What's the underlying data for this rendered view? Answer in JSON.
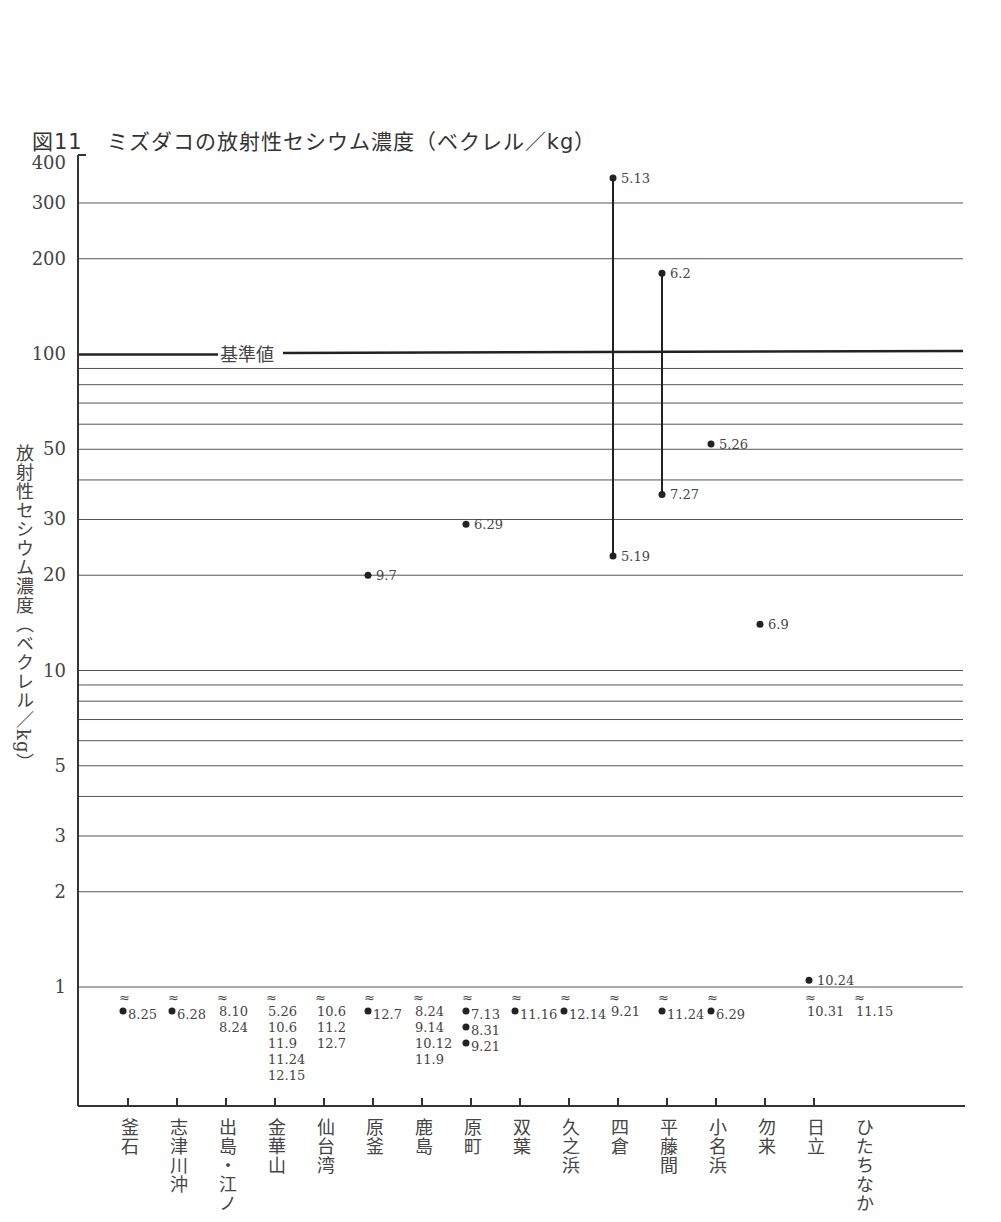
{
  "title": {
    "figure_no": "図11",
    "text": "ミズダコの放射性セシウム濃度（ベクレル／kg）"
  },
  "y_axis_title": "放射性セシウム濃度（ベクレル／kg）",
  "reference_line_label": "基準値",
  "chart_data": {
    "type": "scatter",
    "xlabel": "",
    "ylabel": "放射性セシウム濃度（ベクレル／kg）",
    "yscale": "log",
    "ylim": [
      0.5,
      400
    ],
    "y_ticks": [
      1,
      2,
      3,
      5,
      10,
      20,
      30,
      50,
      100,
      200,
      300,
      400
    ],
    "y_tick_labels": [
      "1",
      "2",
      "3",
      "5",
      "10",
      "20",
      "30",
      "50",
      "100",
      "200",
      "300",
      "400"
    ],
    "grid": true,
    "reference_line": {
      "value": 100,
      "label": "基準値"
    },
    "not_detected_symbol": "≈",
    "categories": [
      "釜石",
      "志津川沖",
      "出島・江ノ",
      "金華山",
      "仙台湾",
      "原釜",
      "鹿島",
      "原町",
      "双葉",
      "久之浜",
      "四倉",
      "平藤間",
      "小名浜",
      "勿来",
      "日立",
      "ひたちなか"
    ],
    "points": [
      {
        "site": "四倉",
        "date": "5.13",
        "value": 360
      },
      {
        "site": "四倉",
        "date": "5.19",
        "value": 23
      },
      {
        "site": "平藤間",
        "date": "6.2",
        "value": 180
      },
      {
        "site": "平藤間",
        "date": "7.27",
        "value": 36
      },
      {
        "site": "小名浜",
        "date": "5.26",
        "value": 52
      },
      {
        "site": "原町",
        "date": "6.29",
        "value": 29
      },
      {
        "site": "原釜",
        "date": "9.7",
        "value": 20
      },
      {
        "site": "勿来",
        "date": "6.9",
        "value": 14
      },
      {
        "site": "日立",
        "date": "10.24",
        "value": 1.05
      }
    ],
    "not_detected": [
      {
        "site": "釜石",
        "dates": [
          "8.25"
        ],
        "with_marker": true
      },
      {
        "site": "志津川沖",
        "dates": [
          "6.28"
        ],
        "with_marker": true
      },
      {
        "site": "出島・江ノ",
        "dates": [
          "8.10",
          "8.24"
        ],
        "with_marker": false
      },
      {
        "site": "金華山",
        "dates": [
          "5.26",
          "10.6",
          "11.9",
          "11.24",
          "12.15"
        ],
        "with_marker": false
      },
      {
        "site": "仙台湾",
        "dates": [
          "10.6",
          "11.2",
          "12.7"
        ],
        "with_marker": false
      },
      {
        "site": "原釜",
        "dates": [
          "12.7"
        ],
        "with_marker": true
      },
      {
        "site": "鹿島",
        "dates": [
          "8.24",
          "9.14",
          "10.12",
          "11.9"
        ],
        "with_marker": false
      },
      {
        "site": "原町",
        "dates": [
          "7.13",
          "8.31",
          "9.21"
        ],
        "with_marker": true
      },
      {
        "site": "双葉",
        "dates": [
          "11.16"
        ],
        "with_marker": true
      },
      {
        "site": "久之浜",
        "dates": [
          "12.14"
        ],
        "with_marker": true
      },
      {
        "site": "四倉",
        "dates": [
          "9.21"
        ],
        "with_marker": false
      },
      {
        "site": "平藤間",
        "dates": [
          "11.24"
        ],
        "with_marker": true
      },
      {
        "site": "小名浜",
        "dates": [
          "6.29"
        ],
        "with_marker": true
      },
      {
        "site": "日立",
        "dates": [
          "10.31"
        ],
        "with_marker": false
      },
      {
        "site": "ひたちなか",
        "dates": [
          "11.15"
        ],
        "with_marker": false
      }
    ]
  }
}
